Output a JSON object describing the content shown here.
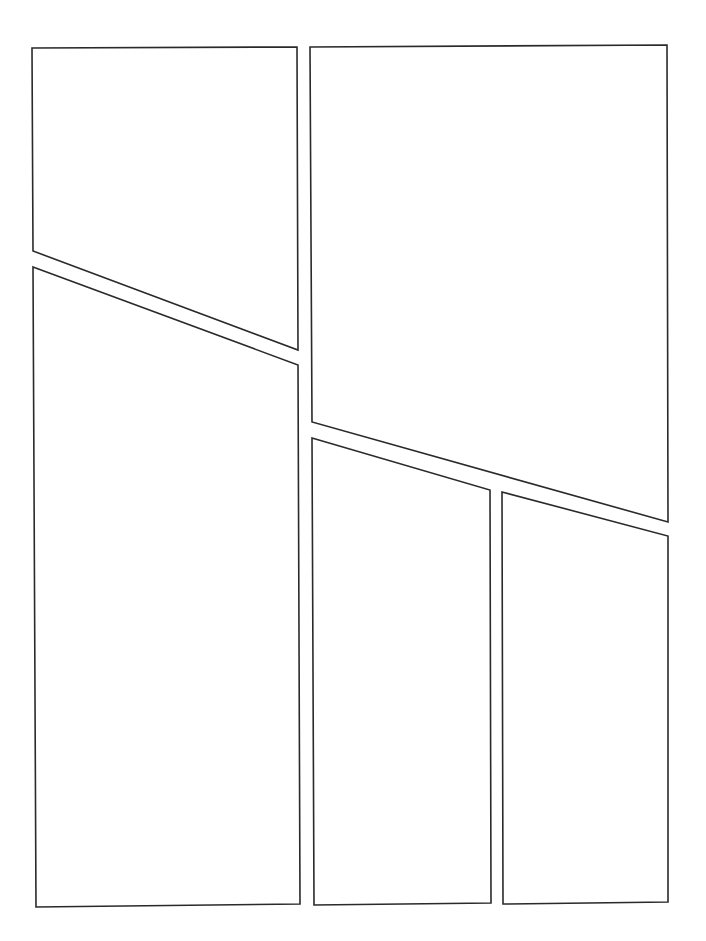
{
  "page": {
    "title": "",
    "width": 706,
    "height": 941,
    "background": "#ffffff",
    "stroke_color": "#2a2a2a"
  },
  "panels": [
    {
      "id": "panel-1",
      "label": "",
      "points": "32,48 297,47 298,350 33,251"
    },
    {
      "id": "panel-2",
      "label": "",
      "points": "310,47 667,45 668,522 312,422"
    },
    {
      "id": "panel-3",
      "label": "",
      "points": "33,267 298,365 300,904 36,907"
    },
    {
      "id": "panel-4",
      "label": "",
      "points": "312,438 490,490 491,903 314,905"
    },
    {
      "id": "panel-5",
      "label": "",
      "points": "502,492 668,536 668,902 503,904"
    }
  ]
}
